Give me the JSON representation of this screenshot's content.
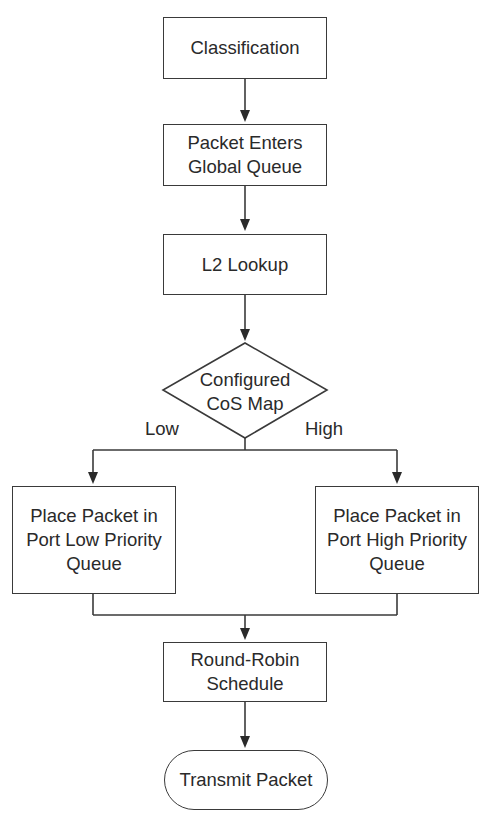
{
  "diagram": {
    "type": "flowchart",
    "nodes": {
      "classification": "Classification",
      "global_queue": "Packet Enters\nGlobal Queue",
      "l2_lookup": "L2 Lookup",
      "cos_map": "Configured\nCoS Map",
      "low_queue": "Place Packet in\nPort Low Priority\nQueue",
      "high_queue": "Place Packet in\nPort High Priority\nQueue",
      "round_robin": "Round-Robin\nSchedule",
      "transmit": "Transmit Packet"
    },
    "edge_labels": {
      "low": "Low",
      "high": "High"
    },
    "colors": {
      "stroke": "#3a3a3a",
      "text": "#2a2a2a",
      "background": "#ffffff"
    }
  }
}
